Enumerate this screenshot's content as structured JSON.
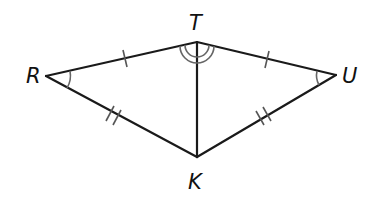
{
  "diagram": {
    "type": "geometry",
    "points": {
      "R": {
        "label": "R",
        "x": 46,
        "y": 76
      },
      "T": {
        "label": "T",
        "x": 197,
        "y": 42
      },
      "U": {
        "label": "U",
        "x": 336,
        "y": 75
      },
      "K": {
        "label": "K",
        "x": 197,
        "y": 157
      }
    },
    "segments": [
      {
        "from": "R",
        "to": "T",
        "tick_marks": 1
      },
      {
        "from": "T",
        "to": "U",
        "tick_marks": 1
      },
      {
        "from": "R",
        "to": "K",
        "tick_marks": 2
      },
      {
        "from": "U",
        "to": "K",
        "tick_marks": 2
      },
      {
        "from": "T",
        "to": "K",
        "tick_marks": 0
      }
    ],
    "angle_marks": [
      {
        "vertex": "R",
        "arcs": 1
      },
      {
        "vertex": "U",
        "arcs": 1
      },
      {
        "vertex": "T",
        "side": "left",
        "arcs": 2,
        "between": [
          "R",
          "K"
        ]
      },
      {
        "vertex": "T",
        "side": "right",
        "arcs": 2,
        "between": [
          "U",
          "K"
        ]
      }
    ],
    "colors": {
      "line": "#1a1a1a",
      "marks": "#555555",
      "background": "#ffffff"
    }
  }
}
